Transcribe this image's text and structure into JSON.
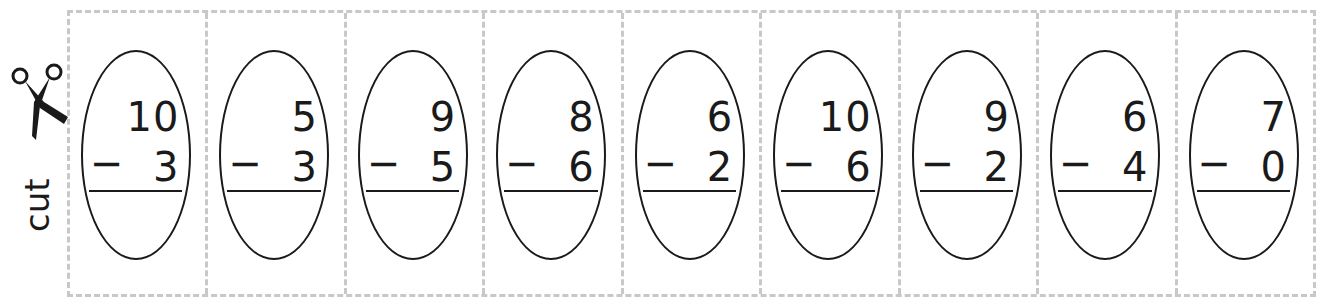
{
  "cut_marker": {
    "label": "cut",
    "icon": "scissors-icon"
  },
  "problems": [
    {
      "minuend": "10",
      "operator": "−",
      "subtrahend": "3"
    },
    {
      "minuend": "5",
      "operator": "−",
      "subtrahend": "3"
    },
    {
      "minuend": "9",
      "operator": "−",
      "subtrahend": "5"
    },
    {
      "minuend": "8",
      "operator": "−",
      "subtrahend": "6"
    },
    {
      "minuend": "6",
      "operator": "−",
      "subtrahend": "2"
    },
    {
      "minuend": "10",
      "operator": "−",
      "subtrahend": "6"
    },
    {
      "minuend": "9",
      "operator": "−",
      "subtrahend": "2"
    },
    {
      "minuend": "6",
      "operator": "−",
      "subtrahend": "4"
    },
    {
      "minuend": "7",
      "operator": "−",
      "subtrahend": "0"
    }
  ],
  "colors": {
    "ink": "#1a1a1a",
    "cut_line": "#c8c8c8"
  }
}
